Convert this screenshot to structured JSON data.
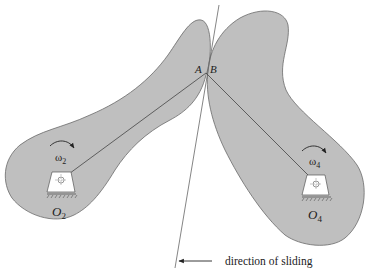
{
  "diagram": {
    "colors": {
      "cam_fill": "#bfbfbf",
      "cam_stroke": "#6a6a6a",
      "line": "#444444",
      "pivot_fill": "#ffffff",
      "text": "#222222"
    },
    "contact_points": {
      "a_label": "A",
      "b_label": "B"
    },
    "left_cam": {
      "pivot_label": "O",
      "pivot_sub": "2",
      "omega_label": "ω",
      "omega_sub": "2",
      "rotation": "clockwise"
    },
    "right_cam": {
      "pivot_label": "O",
      "pivot_sub": "4",
      "omega_label": "ω",
      "omega_sub": "4",
      "rotation": "clockwise"
    },
    "sliding": {
      "label": "direction of sliding",
      "arrow_direction": "left"
    }
  }
}
